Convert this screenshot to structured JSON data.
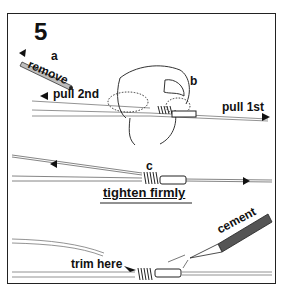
{
  "figure": {
    "step_number": "5",
    "labels": {
      "a": "a",
      "remove": "remove",
      "pull_2nd": "pull 2nd",
      "b": "b",
      "pull_1st": "pull 1st",
      "c": "c",
      "tighten": "tighten  firmly",
      "cement": "cement",
      "trim_here": "trim here"
    },
    "arrows": {
      "left": "◀",
      "right": "▶",
      "tighten_left": "←",
      "tighten_right": "→"
    },
    "colors": {
      "ink": "#111111",
      "line": "#555555",
      "tube": "#9a9a9a",
      "background": "#ffffff"
    }
  }
}
